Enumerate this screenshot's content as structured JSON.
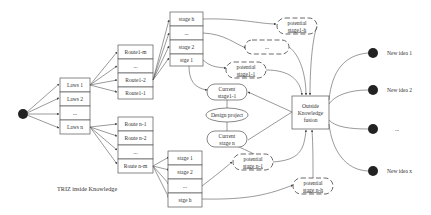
{
  "diagram": {
    "caption": "TRIZ inside Knowledge",
    "root_node": "start-node",
    "laws": [
      "Laws 1",
      "Laws 2",
      "...",
      "Laws n"
    ],
    "routes_top": [
      "Route1-m",
      "...",
      "Route1-2",
      "Route1-1"
    ],
    "routes_bottom": [
      "Route n-1",
      "Route n-2",
      "...",
      "Route n-m"
    ],
    "stages_top": [
      "stage h",
      "...",
      "stage 2",
      "stge 1"
    ],
    "stages_bottom": [
      "stage 1",
      "stage 2",
      "...",
      "stge h"
    ],
    "potentials_top": [
      {
        "line1": "potential",
        "line2": "stage1-h"
      },
      {
        "line1": "...",
        "line2": ""
      },
      {
        "line1": "potential",
        "line2": "stage1-1"
      }
    ],
    "potentials_bottom": [
      {
        "line1": "potential",
        "line2": "stage n-1"
      },
      {
        "line1": "potential",
        "line2": "stage n-h"
      }
    ],
    "current_top": {
      "line1": "Current",
      "line2": "stage1-1"
    },
    "current_bottom": {
      "line1": "Current",
      "line2": "stage n"
    },
    "design_project": "Design project",
    "fusion": {
      "line1": "Outside",
      "line2": "Knowledge",
      "line3": "fusion"
    },
    "new_ideas": [
      "New idea 1",
      "New idea 2",
      "...",
      "New idea x"
    ],
    "colors": {
      "line": "#555555",
      "node": "#222222",
      "background": "#ffffff"
    }
  }
}
